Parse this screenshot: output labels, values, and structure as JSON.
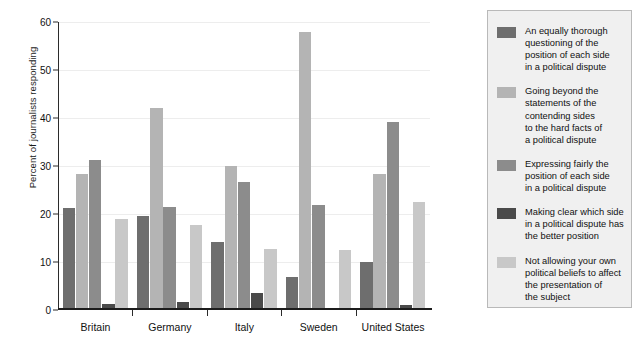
{
  "chart_data": {
    "type": "bar",
    "title": "",
    "subtitle": "",
    "xlabel": "",
    "ylabel": "Percent of journalists responding",
    "ylim": [
      0,
      60
    ],
    "yticks": [
      0,
      10,
      20,
      30,
      40,
      50,
      60
    ],
    "grid": true,
    "legend_position": "right",
    "categories": [
      "Britain",
      "Germany",
      "Italy",
      "Sweden",
      "United States"
    ],
    "series": [
      {
        "name": "An equally thorough questioning of the position of each side in a political dispute",
        "color": "#6e6e6e",
        "values": [
          21.3,
          19.5,
          14.2,
          6.9,
          10.1
        ]
      },
      {
        "name": "Going beyond the statements of the contending sides to the hard facts of a political dispute",
        "color": "#b4b4b4",
        "values": [
          28.4,
          42.1,
          30.0,
          58.0,
          28.3
        ]
      },
      {
        "name": "Expressing fairly the position of each side in a political dispute",
        "color": "#8c8c8c",
        "values": [
          31.2,
          21.5,
          26.7,
          21.9,
          39.1
        ]
      },
      {
        "name": "Making clear which side in a political dispute has the better position",
        "color": "#4a4a4a",
        "values": [
          1.3,
          1.6,
          3.5,
          0.4,
          1.0
        ]
      },
      {
        "name": "Not allowing your own political beliefs to affect the presentation of the subject",
        "color": "#c8c8c8",
        "values": [
          19.0,
          17.7,
          12.8,
          12.4,
          22.5
        ]
      }
    ]
  },
  "legend": {
    "items": [
      {
        "color": "#6e6e6e",
        "lines": [
          "An equally thorough",
          "questioning of the",
          "position of each side",
          "in a political dispute"
        ]
      },
      {
        "color": "#b4b4b4",
        "lines": [
          "Going beyond the",
          "statements of the",
          "contending sides",
          "to the hard facts of",
          "a political dispute"
        ]
      },
      {
        "color": "#8c8c8c",
        "lines": [
          "Expressing fairly the",
          "position of each side",
          "in a political dispute"
        ]
      },
      {
        "color": "#4a4a4a",
        "lines": [
          "Making clear which side",
          "in a political dispute has",
          "the better position"
        ]
      },
      {
        "color": "#c8c8c8",
        "lines": [
          "Not allowing your own",
          "political beliefs to affect",
          "the presentation of",
          "the subject"
        ]
      }
    ]
  },
  "axis": {
    "y_title": "Percent of journalists responding",
    "y_tick_labels": [
      "0",
      "10",
      "20",
      "30",
      "40",
      "50",
      "60"
    ],
    "x_tick_labels": [
      "Britain",
      "Germany",
      "Italy",
      "Sweden",
      "United States"
    ]
  }
}
